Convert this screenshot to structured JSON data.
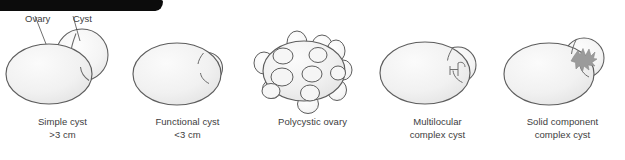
{
  "figure": {
    "title_bar": {
      "name": "black-header-bar",
      "color": "#0c0c0c"
    },
    "colors": {
      "outline": "#5a5a5a",
      "fill_light": "#f7f7f7",
      "fill_mid": "#efefef",
      "fill_shadow": "#e4e4e4",
      "solid_mass": "#9a9a9a",
      "text": "#3d3d3d"
    },
    "annotations": [
      {
        "label": "Ovary",
        "points_to": "ovary-body"
      },
      {
        "label": "Cyst",
        "points_to": "cyst-sac"
      }
    ],
    "panels": [
      {
        "id": "simple-cyst",
        "caption_line1": "Simple cyst",
        "caption_line2": ">3 cm",
        "morphology": "single large anechoic cyst attached to ovary, diameter greater than 3 cm"
      },
      {
        "id": "functional-cyst",
        "caption_line1": "Functional cyst",
        "caption_line2": "<3 cm",
        "morphology": "small simple cyst at ovary margin, diameter less than 3 cm"
      },
      {
        "id": "polycystic-ovary",
        "caption_line1": "Polycystic ovary",
        "caption_line2": "",
        "morphology": "enlarged ovary with multiple small peripheral follicles giving lobulated contour"
      },
      {
        "id": "multilocular-complex-cyst",
        "caption_line1": "Multilocular",
        "caption_line2": "complex cyst",
        "morphology": "cyst containing internal septations dividing it into locules"
      },
      {
        "id": "solid-component-complex-cyst",
        "caption_line1": "Solid component",
        "caption_line2": "complex cyst",
        "morphology": "cyst containing an irregular solid mural nodule"
      }
    ]
  }
}
